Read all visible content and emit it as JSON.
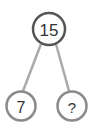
{
  "diagram": {
    "type": "number-bond",
    "whole": {
      "label": "15"
    },
    "parts": [
      {
        "label": "7"
      },
      {
        "label": "?"
      }
    ],
    "colors": {
      "whole_stroke": "#555555",
      "part_stroke": "#8a8a8a",
      "connector": "#aaaaaa",
      "text": "#333333"
    }
  }
}
